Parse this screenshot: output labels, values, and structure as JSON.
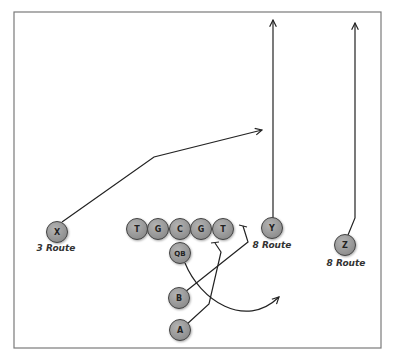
{
  "diagram": {
    "type": "football-play",
    "frame": {
      "x": 14,
      "y": 12,
      "w": 367,
      "h": 336,
      "stroke": "#777777"
    },
    "colors": {
      "player_fill": "#9a9a9a",
      "player_stroke": "#444444",
      "route": "#222222"
    },
    "players": [
      {
        "id": "X",
        "label": "X",
        "x": 57,
        "y": 232,
        "route_label": "3 Route"
      },
      {
        "id": "LT",
        "label": "T",
        "x": 137,
        "y": 229
      },
      {
        "id": "LG",
        "label": "G",
        "x": 158,
        "y": 229
      },
      {
        "id": "C",
        "label": "C",
        "x": 180,
        "y": 229
      },
      {
        "id": "RG",
        "label": "G",
        "x": 201,
        "y": 229
      },
      {
        "id": "RT",
        "label": "T",
        "x": 223,
        "y": 229
      },
      {
        "id": "Y",
        "label": "Y",
        "x": 272,
        "y": 228,
        "route_label": "8 Route"
      },
      {
        "id": "Z",
        "label": "Z",
        "x": 345,
        "y": 245,
        "route_label": "8 Route"
      },
      {
        "id": "QB",
        "label": "QB",
        "x": 180,
        "y": 253
      },
      {
        "id": "B",
        "label": "B",
        "x": 179,
        "y": 298
      },
      {
        "id": "A",
        "label": "A",
        "x": 180,
        "y": 330
      }
    ],
    "labels": {
      "x_route": "3 Route",
      "y_route": "8 Route",
      "z_route": "8 Route"
    }
  }
}
